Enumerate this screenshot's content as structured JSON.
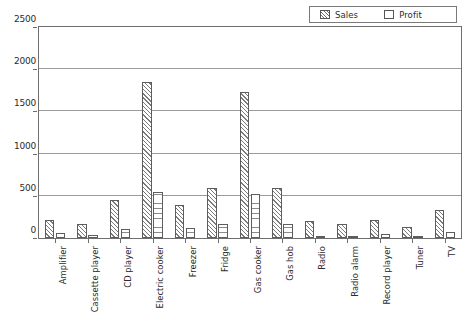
{
  "chart_data": {
    "type": "bar",
    "title": "",
    "subtitle": "",
    "xlabel": "",
    "ylabel": "",
    "ylim": [
      0,
      2500
    ],
    "yticks": [
      0,
      500,
      1000,
      1500,
      2000,
      2500
    ],
    "ytick_labels": [
      "0",
      "500",
      "1000",
      "1500",
      "2000",
      "2500"
    ],
    "grid": true,
    "legend_position": "top-right",
    "categories": [
      "Amplifier",
      "Cassette player",
      "CD player",
      "Electric cooker",
      "Freezer",
      "Fridge",
      "Gas cooker",
      "Gas hob",
      "Radio",
      "Radio alarm",
      "Record player",
      "Tuner",
      "TV"
    ],
    "series": [
      {
        "name": "Sales",
        "pattern": "diagonal-hatch",
        "values": [
          215,
          170,
          450,
          1845,
          395,
          590,
          1725,
          595,
          200,
          165,
          215,
          135,
          330
        ]
      },
      {
        "name": "Profit",
        "pattern": "horizontal-hatch",
        "values": [
          55,
          35,
          110,
          550,
          115,
          170,
          520,
          165,
          25,
          20,
          45,
          25,
          70
        ]
      }
    ]
  },
  "legend": {
    "items": [
      {
        "label": "Sales",
        "swatch": "diagonal-hatch-swatch"
      },
      {
        "label": "Profit",
        "swatch": "empty-swatch"
      }
    ]
  },
  "colors": {
    "background": "#ffffff",
    "axis": "#6f6f6f",
    "gridline": "#9b9b9b",
    "bar_outline": "#5d5d5d",
    "hatch": "#7b7b7b",
    "text": "#2b2b2b"
  }
}
